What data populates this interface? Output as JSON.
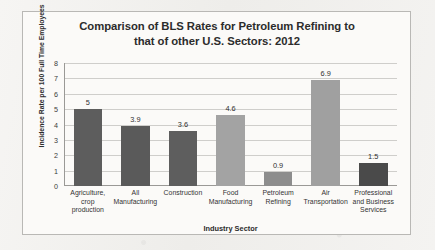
{
  "chart_data": {
    "type": "bar",
    "title": "Comparison of BLS Rates for Petroleum Refining to that of other U.S. Sectors: 2012",
    "title_line1": "Comparison of BLS Rates for Petroleum Refining to",
    "title_line2": "that of other U.S. Sectors: 2012",
    "xlabel": "Industry Sector",
    "ylabel": "Incidence Rate per 100 Full Time Employees",
    "ylim": [
      0,
      8
    ],
    "ytick_step": 1,
    "yticks": [
      "8",
      "7",
      "6",
      "5",
      "4",
      "3",
      "2",
      "1",
      "0"
    ],
    "grid": true,
    "grid_axis": "y",
    "legend": false,
    "categories": [
      "Agriculture, crop production",
      "All Manufacturing",
      "Construction",
      "Food Manufacturing",
      "Petroleum Refining",
      "Air Transportation",
      "Professional and Business Services"
    ],
    "category_lines": [
      [
        "Agriculture,",
        "crop",
        "production"
      ],
      [
        "All",
        "Manufacturing"
      ],
      [
        "Construction"
      ],
      [
        "Food",
        "Manufacturing"
      ],
      [
        "Petroleum",
        "Refining"
      ],
      [
        "Air",
        "Transportation"
      ],
      [
        "Professional",
        "and Business",
        "Services"
      ]
    ],
    "values": [
      5,
      3.9,
      3.6,
      4.6,
      0.9,
      6.9,
      1.5
    ],
    "value_labels": [
      "5",
      "3.9",
      "3.6",
      "4.6",
      "0.9",
      "6.9",
      "1.5"
    ],
    "bar_colors": [
      "#5d5d5d",
      "#5a5a5a",
      "#5e5e5e",
      "#a3a3a3",
      "#8d8d8d",
      "#a0a0a0",
      "#4a4a4a"
    ]
  },
  "style": {
    "plot_background": "#fbfaf8",
    "page_background": "#f2f1ef",
    "gridline_color": "#cfcecb",
    "axis_color": "#9a9996",
    "text_color": "#2c2c2c",
    "border_color": "#b9b8b5"
  }
}
